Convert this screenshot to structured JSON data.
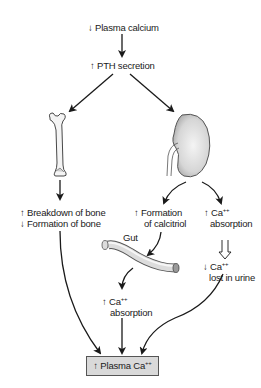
{
  "diagram": {
    "title_node": {
      "arrow": "↓",
      "text": "Plasma calcium"
    },
    "pth_node": {
      "arrow": "↑",
      "text": "PTH secretion"
    },
    "organs": {
      "bone": "bone-icon",
      "kidney": "kidney-icon",
      "gut": "gut-icon"
    },
    "bone_effects": {
      "line1_arrow": "↑",
      "line1": "Breakdown of bone",
      "line2_arrow": "↓",
      "line2": "Formation of bone"
    },
    "kidney_calcitriol": {
      "arrow": "↑",
      "line1": "Formation",
      "line2": "of calcitriol"
    },
    "kidney_reabsorption": {
      "arrow": "↑",
      "ion": "Ca",
      "charge": "++",
      "line2": "absorption"
    },
    "urine_loss": {
      "arrow": "↓",
      "ion": "Ca",
      "charge": "++",
      "line2": "lost in urine"
    },
    "gut_label": "Gut",
    "gut_absorption": {
      "arrow": "↑",
      "ion": "Ca",
      "charge": "++",
      "line2": "absorption"
    },
    "result": {
      "arrow": "↑",
      "text": "Plasma Ca",
      "charge": "++"
    },
    "colors": {
      "line": "#1a1a1a",
      "box_fill": "#d9d9d9",
      "organ_fill": "#e6e6e6",
      "organ_stroke": "#444444"
    }
  }
}
